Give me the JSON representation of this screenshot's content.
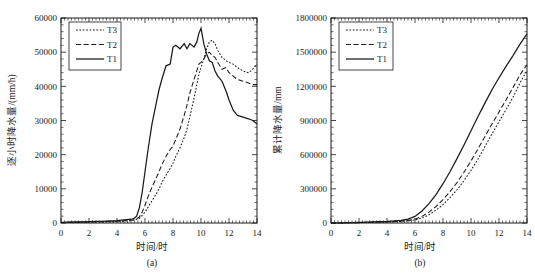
{
  "figure": {
    "panels": [
      {
        "id": "a",
        "caption": "(a)",
        "xlabel": "时间/时",
        "ylabel": "逐小时降水量/(mm/h)",
        "legend_entries": [
          {
            "label": "T3",
            "style": "dotted"
          },
          {
            "label": "T2",
            "style": "dashed"
          },
          {
            "label": "T1",
            "style": "solid"
          }
        ],
        "xticks": [
          "0",
          "2",
          "4",
          "6",
          "8",
          "10",
          "12",
          "14"
        ],
        "yticks": [
          "0",
          "10000",
          "20000",
          "30000",
          "40000",
          "50000",
          "60000"
        ]
      },
      {
        "id": "b",
        "caption": "(b)",
        "xlabel": "时间/时",
        "ylabel": "累计降水量/mm",
        "legend_entries": [
          {
            "label": "T3",
            "style": "dotted"
          },
          {
            "label": "T2",
            "style": "dashed"
          },
          {
            "label": "T1",
            "style": "solid"
          }
        ],
        "xticks": [
          "0",
          "2",
          "4",
          "6",
          "8",
          "10",
          "12",
          "14"
        ],
        "yticks": [
          "0",
          "300000",
          "600000",
          "900000",
          "1200000",
          "1500000",
          "1800000"
        ]
      }
    ]
  },
  "chart_data": [
    {
      "type": "line",
      "panel": "a",
      "title": "",
      "xlabel": "时间/时",
      "ylabel": "逐小时降水量/(mm/h)",
      "xlim": [
        0,
        14
      ],
      "ylim": [
        0,
        60000
      ],
      "xticks": [
        0,
        2,
        4,
        6,
        8,
        10,
        12,
        14
      ],
      "yticks": [
        0,
        10000,
        20000,
        30000,
        40000,
        50000,
        60000
      ],
      "grid": false,
      "legend_position": "upper-left",
      "x": [
        0,
        0.5,
        1,
        1.5,
        2,
        2.5,
        3,
        3.5,
        4,
        4.5,
        5,
        5.2,
        5.4,
        5.6,
        5.8,
        6,
        6.2,
        6.5,
        6.8,
        7,
        7.2,
        7.5,
        7.8,
        8,
        8.2,
        8.5,
        8.8,
        9,
        9.2,
        9.5,
        9.7,
        9.85,
        10,
        10.2,
        10.4,
        10.6,
        10.8,
        11,
        11.2,
        11.5,
        11.8,
        12,
        12.3,
        12.6,
        13,
        13.4,
        13.7,
        14
      ],
      "series": [
        {
          "name": "T1",
          "style": "solid",
          "values": [
            200,
            250,
            300,
            350,
            400,
            450,
            500,
            600,
            700,
            900,
            1100,
            1300,
            2000,
            4500,
            9000,
            15000,
            21000,
            29000,
            35000,
            39000,
            42000,
            46000,
            46500,
            51500,
            52000,
            51000,
            52500,
            51000,
            52500,
            51500,
            53000,
            55500,
            57000,
            52500,
            49500,
            47500,
            47000,
            44500,
            43000,
            41500,
            38500,
            36000,
            33000,
            31500,
            31000,
            30500,
            30000,
            29000
          ]
        },
        {
          "name": "T2",
          "style": "dashed",
          "values": [
            150,
            180,
            210,
            250,
            290,
            330,
            380,
            450,
            520,
            650,
            800,
            950,
            1200,
            1800,
            3200,
            5200,
            7500,
            10500,
            13200,
            15000,
            17000,
            19500,
            21500,
            22500,
            24500,
            27500,
            31500,
            34500,
            38000,
            42000,
            44500,
            46500,
            47000,
            48000,
            49500,
            50000,
            49000,
            48500,
            47000,
            45000,
            45500,
            44000,
            43000,
            42000,
            41500,
            41000,
            40500,
            40500
          ]
        },
        {
          "name": "T3",
          "style": "dotted",
          "values": [
            120,
            140,
            170,
            200,
            240,
            280,
            320,
            380,
            440,
            550,
            680,
            800,
            1000,
            1400,
            2200,
            3200,
            4500,
            6500,
            8500,
            10000,
            11800,
            14000,
            16000,
            17500,
            19500,
            22000,
            25000,
            27500,
            31000,
            36500,
            40500,
            43500,
            45500,
            48000,
            51000,
            53000,
            53500,
            52500,
            50500,
            48500,
            47500,
            47000,
            46500,
            45500,
            44500,
            44000,
            45000,
            46500
          ]
        }
      ]
    },
    {
      "type": "line",
      "panel": "b",
      "title": "",
      "xlabel": "时间/时",
      "ylabel": "累计降水量/mm",
      "xlim": [
        0,
        14
      ],
      "ylim": [
        0,
        1800000
      ],
      "xticks": [
        0,
        2,
        4,
        6,
        8,
        10,
        12,
        14
      ],
      "yticks": [
        0,
        300000,
        600000,
        900000,
        1200000,
        1500000,
        1800000
      ],
      "grid": false,
      "legend_position": "upper-left",
      "x": [
        0,
        1,
        2,
        3,
        4,
        4.5,
        5,
        5.5,
        6,
        6.5,
        7,
        7.5,
        8,
        8.5,
        9,
        9.5,
        10,
        10.5,
        11,
        11.5,
        12,
        12.5,
        13,
        13.5,
        14
      ],
      "series": [
        {
          "name": "T1",
          "style": "solid",
          "values": [
            0,
            2000,
            5000,
            9000,
            14000,
            18000,
            24000,
            34000,
            58000,
            105000,
            170000,
            250000,
            345000,
            450000,
            565000,
            685000,
            810000,
            935000,
            1055000,
            1170000,
            1275000,
            1375000,
            1470000,
            1570000,
            1660000
          ]
        },
        {
          "name": "T2",
          "style": "dashed",
          "values": [
            0,
            1500,
            3500,
            6500,
            10000,
            13000,
            17000,
            23000,
            34000,
            58000,
            95000,
            145000,
            205000,
            275000,
            355000,
            445000,
            545000,
            650000,
            760000,
            870000,
            975000,
            1080000,
            1190000,
            1300000,
            1390000
          ]
        },
        {
          "name": "T3",
          "style": "dotted",
          "values": [
            0,
            1200,
            2800,
            5200,
            8200,
            10800,
            14000,
            19000,
            27000,
            44000,
            72000,
            112000,
            162000,
            222000,
            292000,
            372000,
            462000,
            562000,
            672000,
            782000,
            890000,
            995000,
            1105000,
            1230000,
            1340000
          ]
        }
      ]
    }
  ]
}
